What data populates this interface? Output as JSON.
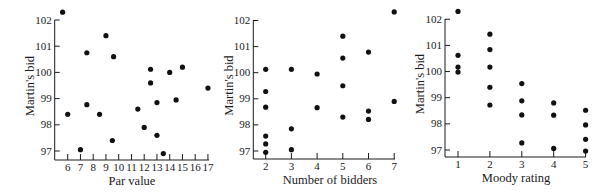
{
  "chart_data": [
    {
      "type": "scatter",
      "title": "",
      "xlabel": "Par value",
      "ylabel": "Martin's bid",
      "xlim": [
        5.1,
        17.2
      ],
      "ylim": [
        96.7,
        102
      ],
      "grid": false,
      "legend": null,
      "x_ticks": [
        6,
        7,
        8,
        9,
        10,
        11,
        12,
        13,
        14,
        15,
        16,
        17
      ],
      "y_ticks": [
        97,
        98,
        99,
        100,
        101,
        102
      ],
      "points": [
        {
          "x": 5.6,
          "y": 102.3
        },
        {
          "x": 6.0,
          "y": 98.4
        },
        {
          "x": 7.0,
          "y": 97.05
        },
        {
          "x": 7.5,
          "y": 100.75
        },
        {
          "x": 7.5,
          "y": 98.77
        },
        {
          "x": 8.5,
          "y": 98.4
        },
        {
          "x": 9.0,
          "y": 101.4
        },
        {
          "x": 9.6,
          "y": 100.6
        },
        {
          "x": 9.5,
          "y": 97.4
        },
        {
          "x": 11.5,
          "y": 98.6
        },
        {
          "x": 12.0,
          "y": 97.9
        },
        {
          "x": 12.5,
          "y": 100.12
        },
        {
          "x": 12.5,
          "y": 99.6
        },
        {
          "x": 13.0,
          "y": 98.85
        },
        {
          "x": 13.0,
          "y": 97.6
        },
        {
          "x": 13.5,
          "y": 96.9
        },
        {
          "x": 14.0,
          "y": 100.0
        },
        {
          "x": 14.5,
          "y": 98.95
        },
        {
          "x": 15.0,
          "y": 100.2
        },
        {
          "x": 17.0,
          "y": 99.4
        }
      ]
    },
    {
      "type": "scatter",
      "title": "",
      "xlabel": "Number of bidders",
      "ylabel": "Martin's bid",
      "xlim": [
        1.55,
        7.1
      ],
      "ylim": [
        96.7,
        102
      ],
      "grid": false,
      "legend": null,
      "x_ticks": [
        2,
        3,
        4,
        5,
        6,
        7
      ],
      "y_ticks": [
        97,
        98,
        99,
        100,
        101,
        102
      ],
      "points": [
        {
          "x": 2,
          "y": 100.13
        },
        {
          "x": 2,
          "y": 99.28
        },
        {
          "x": 2,
          "y": 98.68
        },
        {
          "x": 2,
          "y": 97.57
        },
        {
          "x": 2,
          "y": 97.27
        },
        {
          "x": 2,
          "y": 96.95
        },
        {
          "x": 3,
          "y": 100.13
        },
        {
          "x": 3,
          "y": 97.85
        },
        {
          "x": 3,
          "y": 97.05
        },
        {
          "x": 4,
          "y": 99.95
        },
        {
          "x": 4,
          "y": 98.66
        },
        {
          "x": 5,
          "y": 101.4
        },
        {
          "x": 5,
          "y": 100.56
        },
        {
          "x": 5,
          "y": 99.5
        },
        {
          "x": 5,
          "y": 98.3
        },
        {
          "x": 6,
          "y": 100.79
        },
        {
          "x": 6,
          "y": 98.53
        },
        {
          "x": 6,
          "y": 98.21
        },
        {
          "x": 7,
          "y": 102.33
        },
        {
          "x": 7,
          "y": 98.9
        }
      ]
    },
    {
      "type": "scatter",
      "title": "",
      "xlabel": "Moody rating",
      "ylabel": "Martin's bid",
      "xlim": [
        0.6,
        5.05
      ],
      "ylim": [
        96.7,
        102
      ],
      "grid": false,
      "legend": null,
      "x_ticks": [
        1,
        2,
        3,
        4,
        5
      ],
      "y_ticks": [
        97,
        98,
        99,
        100,
        101,
        102
      ],
      "points": [
        {
          "x": 1,
          "y": 102.3
        },
        {
          "x": 1,
          "y": 100.62
        },
        {
          "x": 1,
          "y": 100.17
        },
        {
          "x": 1,
          "y": 99.98
        },
        {
          "x": 2,
          "y": 101.43
        },
        {
          "x": 2,
          "y": 100.84
        },
        {
          "x": 2,
          "y": 100.17
        },
        {
          "x": 2,
          "y": 99.4
        },
        {
          "x": 2,
          "y": 98.72
        },
        {
          "x": 3,
          "y": 99.54
        },
        {
          "x": 3,
          "y": 98.88
        },
        {
          "x": 3,
          "y": 98.34
        },
        {
          "x": 3,
          "y": 97.27
        },
        {
          "x": 4,
          "y": 98.8
        },
        {
          "x": 4,
          "y": 98.33
        },
        {
          "x": 4,
          "y": 97.06
        },
        {
          "x": 5,
          "y": 98.52
        },
        {
          "x": 5,
          "y": 97.96
        },
        {
          "x": 5,
          "y": 97.41
        },
        {
          "x": 5,
          "y": 96.96
        }
      ]
    }
  ],
  "layout": [
    {
      "axis_x": 54.7,
      "axis_x_end": 209,
      "axis_y_top": 20,
      "axis_y_bottom": 160,
      "x0_val": 6,
      "x0_px": 67.7,
      "px_per_x": 12.75,
      "y97_px": 151,
      "px_per_y": 26.2,
      "xlabel_x": 132,
      "ylabel_x": 34
    },
    {
      "axis_x": 253.3,
      "axis_x_end": 395,
      "axis_y_top": 20,
      "axis_y_bottom": 159,
      "x0_val": 2,
      "x0_px": 265.7,
      "px_per_x": 25.7,
      "y97_px": 151,
      "px_per_y": 26.1,
      "xlabel_x": 330,
      "ylabel_x": 233
    },
    {
      "axis_x": 445,
      "axis_x_end": 586,
      "axis_y_top": 19,
      "axis_y_bottom": 157,
      "x0_val": 1,
      "x0_px": 458,
      "px_per_x": 31.9,
      "y97_px": 150,
      "px_per_y": 26.15,
      "xlabel_x": 516,
      "ylabel_x": 424
    }
  ],
  "style": {
    "ink_color": "#111111",
    "background": "#ffffff",
    "dot_radius": 2.6
  }
}
